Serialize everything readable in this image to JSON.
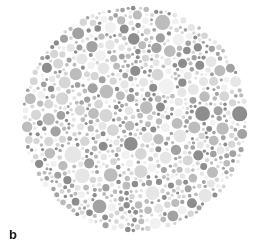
{
  "figure": {
    "kind": "ishihara-pseudoisochromatic-plate",
    "panel_label": "b",
    "background_color": "#ffffff",
    "width": 273,
    "height": 252
  },
  "plate": {
    "shape": "circle",
    "center_x": 135,
    "center_y": 119,
    "radius": 114,
    "dot_count": 1150,
    "dot_min_diameter": 3,
    "dot_max_diameter": 17,
    "dot_gap": 0.6,
    "hidden_figure_visible": false,
    "palette": [
      {
        "name": "dark-gray",
        "hex": "#8d8d8d",
        "weight": 20
      },
      {
        "name": "mid-gray",
        "hex": "#a2a2a2",
        "weight": 16
      },
      {
        "name": "light-mid-gray",
        "hex": "#bcbcbc",
        "weight": 18
      },
      {
        "name": "light-gray",
        "hex": "#d6d6d6",
        "weight": 22
      },
      {
        "name": "pale-gray",
        "hex": "#e6e6e6",
        "weight": 16
      },
      {
        "name": "near-white-gray",
        "hex": "#f1f1f1",
        "weight": 8
      }
    ],
    "seed": 20250411
  },
  "chart_data": {
    "type": "scatter",
    "title": "",
    "xlabel": "",
    "ylabel": "",
    "annotations": [
      "b"
    ],
    "legend": [],
    "grid": false,
    "xlim": [
      21,
      249
    ],
    "ylim": [
      5,
      233
    ],
    "note": "Pseudoisochromatic Ishihara test plate reproduced in grayscale; circular field of randomly packed dots of six gray tones and varying radii. No chromatic figure is resolvable in the grayscale reproduction."
  }
}
